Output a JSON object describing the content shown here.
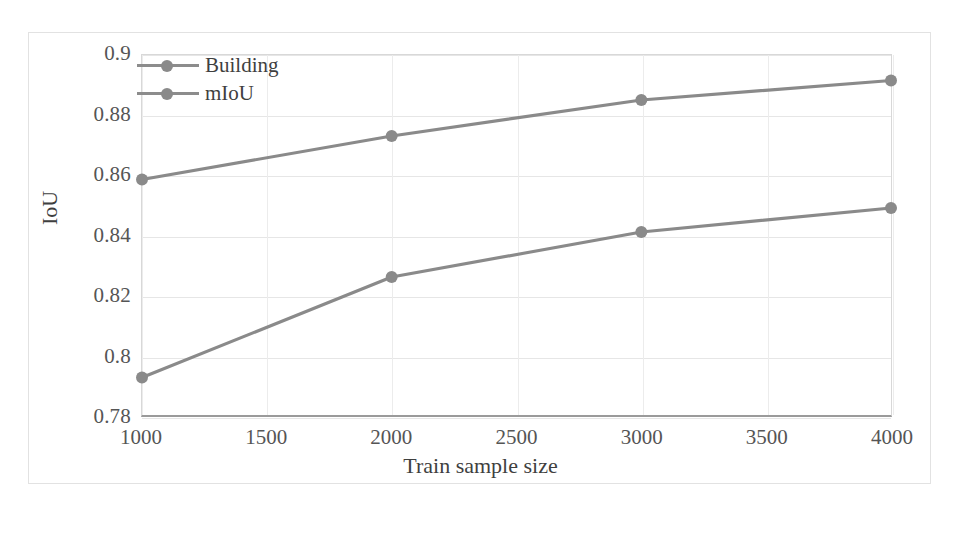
{
  "chart_data": {
    "type": "line",
    "title": "",
    "xlabel": "Train sample size",
    "ylabel": "IoU",
    "x": [
      1000,
      2000,
      3000,
      4000
    ],
    "xlim": [
      1000,
      4000
    ],
    "ylim": [
      0.78,
      0.9
    ],
    "xticks": [
      "1000",
      "1500",
      "2000",
      "2500",
      "3000",
      "3500",
      "4000"
    ],
    "xtick_values": [
      1000,
      1500,
      2000,
      2500,
      3000,
      3500,
      4000
    ],
    "yticks": [
      "0.9",
      "0.88",
      "0.86",
      "0.84",
      "0.82",
      "0.8",
      "0.78"
    ],
    "ytick_values": [
      0.9,
      0.88,
      0.86,
      0.84,
      0.82,
      0.8,
      0.78
    ],
    "grid": true,
    "legend_position": "top-left",
    "series": [
      {
        "name": "Building",
        "values": [
          0.8585,
          0.873,
          0.885,
          0.8915
        ],
        "color": "#8a8a8a",
        "marker": "circle"
      },
      {
        "name": "mIoU",
        "values": [
          0.7925,
          0.826,
          0.841,
          0.849
        ],
        "color": "#8a8a8a",
        "marker": "circle"
      }
    ]
  },
  "legend": {
    "items": [
      {
        "label": "Building"
      },
      {
        "label": "mIoU"
      }
    ]
  },
  "axes": {
    "y_title": "IoU",
    "x_title": "Train sample size"
  },
  "caption": {
    "text": ""
  }
}
